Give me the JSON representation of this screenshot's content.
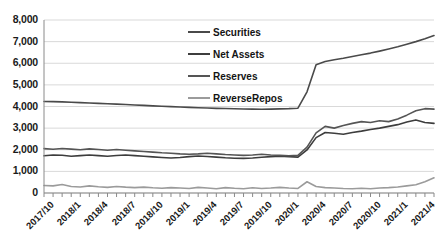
{
  "chart_data": {
    "type": "line",
    "title": "",
    "xlabel": "",
    "ylabel": "",
    "ylim": [
      0,
      8000
    ],
    "ytick_labels": [
      "8,000",
      "7,000",
      "6,000",
      "5,000",
      "4,000",
      "3,000",
      "2,000",
      "1,000",
      "0"
    ],
    "ytick_values": [
      8000,
      7000,
      6000,
      5000,
      4000,
      3000,
      2000,
      1000,
      0
    ],
    "grid": true,
    "legend_position": "top-center",
    "x_tick_labels": [
      "2017/10",
      "2018/1",
      "2018/4",
      "2018/7",
      "2018/10",
      "2019/1",
      "2019/4",
      "2019/7",
      "2019/10",
      "2020/1",
      "2020/4",
      "2020/7",
      "2020/10",
      "2021/1",
      "2021/4"
    ],
    "x": [
      "2017/10",
      "2017/11",
      "2017/12",
      "2018/1",
      "2018/2",
      "2018/3",
      "2018/4",
      "2018/5",
      "2018/6",
      "2018/7",
      "2018/8",
      "2018/9",
      "2018/10",
      "2018/11",
      "2018/12",
      "2019/1",
      "2019/2",
      "2019/3",
      "2019/4",
      "2019/5",
      "2019/6",
      "2019/7",
      "2019/8",
      "2019/9",
      "2019/10",
      "2019/11",
      "2019/12",
      "2020/1",
      "2020/2",
      "2020/3",
      "2020/4",
      "2020/5",
      "2020/6",
      "2020/7",
      "2020/8",
      "2020/9",
      "2020/10",
      "2020/11",
      "2020/12",
      "2021/1",
      "2021/2",
      "2021/3",
      "2021/4",
      "2021/5"
    ],
    "series": [
      {
        "name": "Securities",
        "color": "#4a4a4a",
        "values": [
          4230,
          4225,
          4215,
          4195,
          4180,
          4165,
          4145,
          4125,
          4110,
          4090,
          4070,
          4050,
          4030,
          4010,
          3995,
          3975,
          3960,
          3945,
          3930,
          3915,
          3905,
          3895,
          3885,
          3880,
          3875,
          3880,
          3890,
          3900,
          3920,
          4680,
          5930,
          6080,
          6160,
          6230,
          6310,
          6390,
          6470,
          6560,
          6660,
          6760,
          6880,
          7000,
          7130,
          7280
        ]
      },
      {
        "name": "Net Assets",
        "color": "#3d3d3d",
        "values": [
          1720,
          1760,
          1745,
          1700,
          1730,
          1760,
          1730,
          1700,
          1735,
          1760,
          1730,
          1700,
          1670,
          1640,
          1620,
          1640,
          1680,
          1710,
          1690,
          1660,
          1630,
          1610,
          1600,
          1620,
          1650,
          1680,
          1700,
          1680,
          1660,
          1990,
          2560,
          2800,
          2760,
          2720,
          2800,
          2860,
          2940,
          3000,
          3080,
          3160,
          3280,
          3380,
          3260,
          3220
        ]
      },
      {
        "name": "Reserves",
        "color": "#555555",
        "values": [
          2050,
          2020,
          2060,
          2030,
          2000,
          2040,
          2010,
          1980,
          2010,
          1980,
          1950,
          1920,
          1890,
          1860,
          1840,
          1810,
          1790,
          1810,
          1840,
          1810,
          1780,
          1760,
          1740,
          1760,
          1790,
          1760,
          1740,
          1720,
          1740,
          2120,
          2780,
          3080,
          3000,
          3120,
          3220,
          3300,
          3260,
          3340,
          3300,
          3420,
          3600,
          3800,
          3900,
          3880
        ]
      },
      {
        "name": "ReverseRepos",
        "color": "#9b9b9b",
        "values": [
          350,
          330,
          390,
          300,
          280,
          330,
          290,
          260,
          300,
          270,
          250,
          270,
          240,
          220,
          250,
          230,
          210,
          260,
          230,
          200,
          250,
          220,
          200,
          240,
          210,
          230,
          260,
          230,
          210,
          520,
          300,
          250,
          230,
          210,
          200,
          220,
          200,
          230,
          250,
          280,
          330,
          380,
          520,
          700
        ]
      }
    ]
  }
}
